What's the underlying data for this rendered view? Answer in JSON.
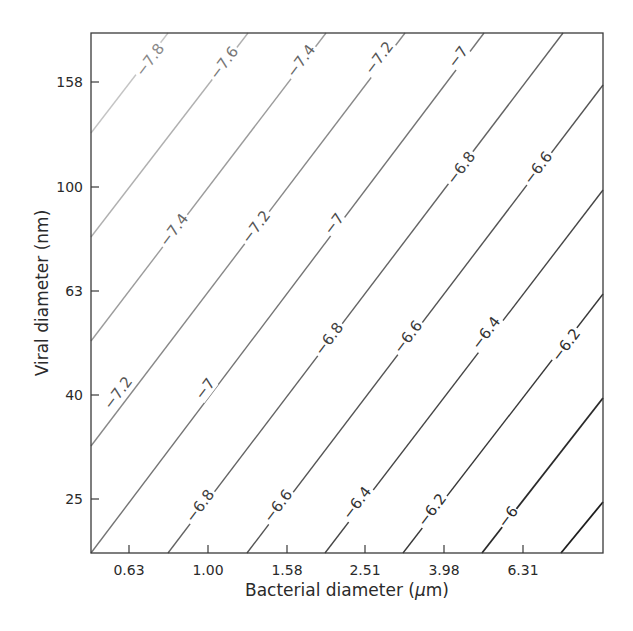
{
  "chart_data": {
    "type": "contour",
    "title": "",
    "xlabel": "Bacterial diameter (μm)",
    "xlabel_parts": {
      "prefix": "Bacterial diameter (",
      "mu": "μ",
      "suffix": "m)"
    },
    "ylabel": "Viral diameter (nm)",
    "x_scale": "log",
    "y_scale": "log",
    "x_ticks": [
      "0.63",
      "1.00",
      "1.58",
      "2.51",
      "3.98",
      "6.31"
    ],
    "y_ticks": [
      "25",
      "40",
      "63",
      "100",
      "158"
    ],
    "xlim": [
      0.48,
      12.0
    ],
    "ylim": [
      19.5,
      200
    ],
    "grid": false,
    "legend": null,
    "contour_levels": [
      -7.8,
      -7.6,
      -7.4,
      -7.2,
      -7.0,
      -6.8,
      -6.6,
      -6.4,
      -6.2,
      -6.0,
      -5.8
    ],
    "contours": [
      {
        "level": -7.8,
        "color": "#c4c4c4",
        "labels": [
          "-7.8"
        ]
      },
      {
        "level": -7.6,
        "color": "#b0b0b0",
        "labels": [
          "-7.6"
        ]
      },
      {
        "level": -7.4,
        "color": "#9c9c9c",
        "labels": [
          "-7.4",
          "-7.4"
        ]
      },
      {
        "level": -7.2,
        "color": "#888888",
        "labels": [
          "-7.2",
          "-7.2",
          "-7.2"
        ]
      },
      {
        "level": -7.0,
        "color": "#747474",
        "labels": [
          "-7",
          "-7",
          "-7"
        ]
      },
      {
        "level": -6.8,
        "color": "#636363",
        "labels": [
          "-6.8",
          "-6.8",
          "-6.8"
        ]
      },
      {
        "level": -6.6,
        "color": "#545454",
        "labels": [
          "-6.6",
          "-6.6",
          "-6.6"
        ]
      },
      {
        "level": -6.4,
        "color": "#464646",
        "labels": [
          "-6.4",
          "-6.4"
        ]
      },
      {
        "level": -6.2,
        "color": "#383838",
        "labels": [
          "-6.2",
          "-6.2"
        ]
      },
      {
        "level": -6.0,
        "color": "#2a2a2a",
        "labels": [
          "-6"
        ]
      },
      {
        "level": -5.8,
        "color": "#1e1e1e",
        "labels": []
      }
    ]
  },
  "plot_box": {
    "left": 91,
    "top": 33,
    "right": 603,
    "bottom": 553
  },
  "lines": [
    {
      "level": "-7.8",
      "x1": 91,
      "y1": 133,
      "x2": 168,
      "y2": 33,
      "color": "#c4c4c4"
    },
    {
      "level": "-7.6",
      "x1": 91,
      "y1": 237,
      "x2": 248,
      "y2": 33,
      "color": "#b0b0b0"
    },
    {
      "level": "-7.4",
      "x1": 91,
      "y1": 341,
      "x2": 326,
      "y2": 33,
      "color": "#9c9c9c"
    },
    {
      "level": "-7.2",
      "x1": 91,
      "y1": 446,
      "x2": 405,
      "y2": 33,
      "color": "#888888"
    },
    {
      "level": "-7",
      "x1": 91,
      "y1": 553,
      "x2": 484,
      "y2": 33,
      "color": "#747474"
    },
    {
      "level": "-6.8",
      "x1": 168,
      "y1": 553,
      "x2": 563,
      "y2": 33,
      "color": "#636363"
    },
    {
      "level": "-6.6",
      "x1": 247,
      "y1": 553,
      "x2": 603,
      "y2": 85,
      "color": "#545454"
    },
    {
      "level": "-6.4",
      "x1": 325,
      "y1": 553,
      "x2": 603,
      "y2": 190,
      "color": "#464646"
    },
    {
      "level": "-6.2",
      "x1": 403,
      "y1": 553,
      "x2": 603,
      "y2": 294,
      "color": "#383838"
    },
    {
      "level": "-6",
      "x1": 482,
      "y1": 553,
      "x2": 603,
      "y2": 398,
      "color": "#2a2a2a"
    },
    {
      "level": "-5.8",
      "x1": 561,
      "y1": 553,
      "x2": 603,
      "y2": 502,
      "color": "#1e1e1e"
    }
  ],
  "labels": [
    {
      "text": "−7.8",
      "x": 150,
      "y": 60,
      "color": "#888888"
    },
    {
      "text": "−7.6",
      "x": 224,
      "y": 63,
      "color": "#777777"
    },
    {
      "text": "−7.4",
      "x": 301,
      "y": 61,
      "color": "#666666"
    },
    {
      "text": "−7.2",
      "x": 379,
      "y": 58,
      "color": "#555555"
    },
    {
      "text": "−7",
      "x": 458,
      "y": 57,
      "color": "#4a4a4a"
    },
    {
      "text": "−7.4",
      "x": 174,
      "y": 230,
      "color": "#666666"
    },
    {
      "text": "−7.2",
      "x": 256,
      "y": 227,
      "color": "#555555"
    },
    {
      "text": "−7",
      "x": 334,
      "y": 224,
      "color": "#4a4a4a"
    },
    {
      "text": "−6.8",
      "x": 461,
      "y": 168,
      "color": "#404040"
    },
    {
      "text": "−6.6",
      "x": 538,
      "y": 168,
      "color": "#3a3a3a"
    },
    {
      "text": "−7.2",
      "x": 118,
      "y": 393,
      "color": "#555555"
    },
    {
      "text": "−7",
      "x": 205,
      "y": 389,
      "color": "#4a4a4a"
    },
    {
      "text": "−6.8",
      "x": 329,
      "y": 339,
      "color": "#404040"
    },
    {
      "text": "−6.6",
      "x": 408,
      "y": 337,
      "color": "#3a3a3a"
    },
    {
      "text": "−6.4",
      "x": 486,
      "y": 333,
      "color": "#333333"
    },
    {
      "text": "−6.2",
      "x": 566,
      "y": 345,
      "color": "#2e2e2e"
    },
    {
      "text": "−6.8",
      "x": 200,
      "y": 506,
      "color": "#404040"
    },
    {
      "text": "−6.6",
      "x": 278,
      "y": 506,
      "color": "#3a3a3a"
    },
    {
      "text": "−6.4",
      "x": 357,
      "y": 503,
      "color": "#333333"
    },
    {
      "text": "−6.2",
      "x": 432,
      "y": 510,
      "color": "#2e2e2e"
    },
    {
      "text": "−6",
      "x": 508,
      "y": 517,
      "color": "#2a2a2a"
    }
  ],
  "x_tick_positions": [
    {
      "label": "0.63",
      "x": 129
    },
    {
      "label": "1.00",
      "x": 208
    },
    {
      "label": "1.58",
      "x": 287
    },
    {
      "label": "2.51",
      "x": 365
    },
    {
      "label": "3.98",
      "x": 444
    },
    {
      "label": "6.31",
      "x": 523
    }
  ],
  "y_tick_positions": [
    {
      "label": "158",
      "y": 82
    },
    {
      "label": "100",
      "y": 187
    },
    {
      "label": "63",
      "y": 291
    },
    {
      "label": "40",
      "y": 395
    },
    {
      "label": "25",
      "y": 499
    }
  ]
}
